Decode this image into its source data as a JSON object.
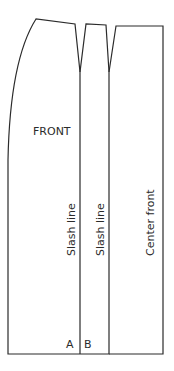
{
  "diagram": {
    "type": "sewing-pattern",
    "stroke_color": "#2b2b2b",
    "labels": {
      "front": "FRONT",
      "slash_line_1": "Slash line",
      "slash_line_2": "Slash line",
      "center_front": "Center front",
      "point_a": "A",
      "point_b": "B"
    },
    "pieces": [
      {
        "name": "side-panel",
        "description": "curved side seam with dart at top"
      },
      {
        "name": "middle-panel",
        "description": "narrow strip between slash lines with dart"
      },
      {
        "name": "center-front-panel",
        "description": "rectangular panel at center front"
      }
    ]
  }
}
